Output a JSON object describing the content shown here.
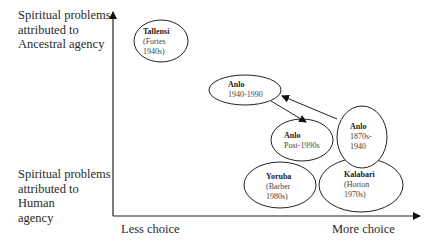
{
  "y_axis": {
    "top_label": "Spiritual problems attributed to Ancestral agency",
    "top_lines": [
      "Spiritual problems",
      "attributed to",
      "Ancestral agency"
    ],
    "bottom_label": "Spiritual problems attributed to Human agency",
    "bottom_lines": [
      "Spiritual problems",
      "attributed to",
      "Human",
      "agency"
    ]
  },
  "x_axis": {
    "left_label": "Less choice",
    "right_label": "More choice"
  },
  "nodes": [
    {
      "id": "tallensi",
      "title": "Tallensi",
      "sub": "(Fortes\n1940s)"
    },
    {
      "id": "anlo-1940-1990",
      "title": "Anlo",
      "sub": "1940-1990"
    },
    {
      "id": "anlo-post-1990s",
      "title": "Anlo",
      "sub": "Post-1990s"
    },
    {
      "id": "anlo-1870s-1940",
      "title": "Anlo",
      "sub": "1870s-\n1940"
    },
    {
      "id": "yoruba",
      "title": "Yoruba",
      "sub": "(Barber\n1980s)"
    },
    {
      "id": "kalabari",
      "title": "Kalabari",
      "sub": "(Horton\n1970s)"
    }
  ],
  "arrows": [
    {
      "from": "Anlo 1870s-1940",
      "to": "Anlo 1940-1990"
    },
    {
      "from": "Anlo 1940-1990",
      "to": "Anlo Post-1990s"
    }
  ]
}
